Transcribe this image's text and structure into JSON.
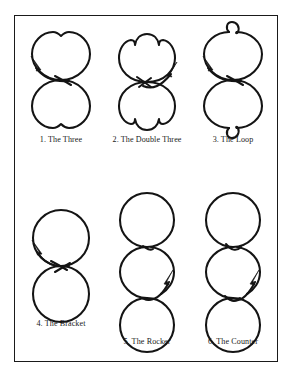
{
  "plate": {
    "title": "Figure Skating School Figures",
    "border_color": "#1a1a1a",
    "background_color": "#ffffff",
    "ink_color": "#141414",
    "rows": 2,
    "columns": 3
  },
  "figures": [
    {
      "number": "1.",
      "name": "The Three",
      "caption": "1.  The Three",
      "shape": "two-tangent-circles-with-cusps",
      "circles": 2,
      "cusps": 2,
      "loops": 0,
      "arrow": "upper-left"
    },
    {
      "number": "2.",
      "name": "The Double Three",
      "caption": "2.  The Double Three",
      "shape": "two-lobes-with-double-cusps",
      "circles": 2,
      "cusps": 4,
      "loops": 0,
      "arrow": "upper-right"
    },
    {
      "number": "3.",
      "name": "The Loop",
      "caption": "3.  The Loop",
      "shape": "two-tangent-circles-with-small-loops",
      "circles": 2,
      "cusps": 0,
      "loops": 2,
      "arrow": "upper-left"
    },
    {
      "number": "4.",
      "name": "The Bracket",
      "caption": "4.  The Bracket",
      "shape": "two-tangent-circles-plain",
      "circles": 2,
      "cusps": 0,
      "loops": 0,
      "arrow": "upper-left"
    },
    {
      "number": "5.",
      "name": "The Rocker",
      "caption": "5.  The Rocker",
      "shape": "three-tangent-circles",
      "circles": 3,
      "cusps": 2,
      "loops": 0,
      "arrow": "upper-right"
    },
    {
      "number": "6.",
      "name": "The Counter",
      "caption": "6.  The Counter",
      "shape": "three-tangent-circles-with-cusps",
      "circles": 3,
      "cusps": 2,
      "loops": 0,
      "arrow": "upper-right"
    }
  ]
}
